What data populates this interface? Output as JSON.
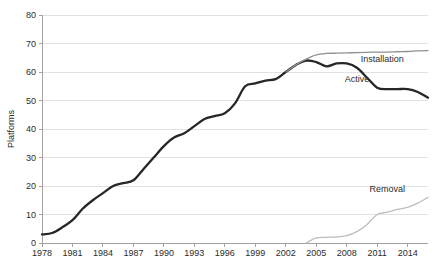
{
  "chart_data": {
    "type": "line",
    "title": "",
    "xlabel": "",
    "ylabel": "Platforms",
    "xlim": [
      1978,
      2016
    ],
    "ylim": [
      0,
      80
    ],
    "ytick_step": 10,
    "xtick_step": 3,
    "grid": true,
    "legend_position": "inline-labels",
    "yticks": [
      "0",
      "10",
      "20",
      "30",
      "40",
      "50",
      "60",
      "70",
      "80"
    ],
    "xticks": [
      "1978",
      "1981",
      "1984",
      "1987",
      "1990",
      "1993",
      "1996",
      "1999",
      "2002",
      "2005",
      "2008",
      "2011",
      "2014"
    ],
    "series": [
      {
        "name": "Active",
        "color": "#262626",
        "width": 2.3,
        "label_x": 2009.0,
        "label_y": 56.5,
        "x": [
          1978,
          1979,
          1980,
          1981,
          1982,
          1983,
          1984,
          1985,
          1986,
          1987,
          1988,
          1989,
          1990,
          1991,
          1992,
          1993,
          1994,
          1995,
          1996,
          1997,
          1998,
          1999,
          2000,
          2001,
          2002,
          2003,
          2004,
          2005,
          2006,
          2007,
          2008,
          2009,
          2010,
          2011,
          2012,
          2013,
          2014,
          2015,
          2016
        ],
        "values": [
          3,
          3.5,
          5.5,
          8,
          12,
          15,
          17.5,
          20,
          21,
          22,
          26,
          30,
          34,
          37,
          38.5,
          41,
          43.5,
          44.5,
          45.5,
          49,
          55,
          56,
          57,
          57.5,
          60,
          62.5,
          64,
          63.5,
          62,
          63,
          63,
          61.5,
          58,
          54.5,
          54,
          54,
          54,
          53,
          51
        ]
      },
      {
        "name": "Installation",
        "color": "#8f8f8f",
        "width": 1.3,
        "label_x": 2011.5,
        "label_y": 63.5,
        "x": [
          2002,
          2003,
          2004,
          2005,
          2006,
          2007,
          2008,
          2009,
          2010,
          2011,
          2012,
          2013,
          2014,
          2015,
          2016
        ],
        "values": [
          60,
          62.5,
          64.5,
          66,
          66.5,
          66.6,
          66.7,
          66.8,
          66.9,
          67,
          67,
          67.1,
          67.2,
          67.4,
          67.5
        ]
      },
      {
        "name": "Removal",
        "color": "#bdbdbd",
        "width": 1.3,
        "label_x": 2012.0,
        "label_y": 18.0,
        "x": [
          2004,
          2005,
          2006,
          2007,
          2008,
          2009,
          2010,
          2011,
          2012,
          2013,
          2014,
          2015,
          2016
        ],
        "values": [
          0,
          1.8,
          2.0,
          2.1,
          2.6,
          4.0,
          6.5,
          10.0,
          10.8,
          11.8,
          12.5,
          14.0,
          16.0
        ]
      }
    ]
  }
}
